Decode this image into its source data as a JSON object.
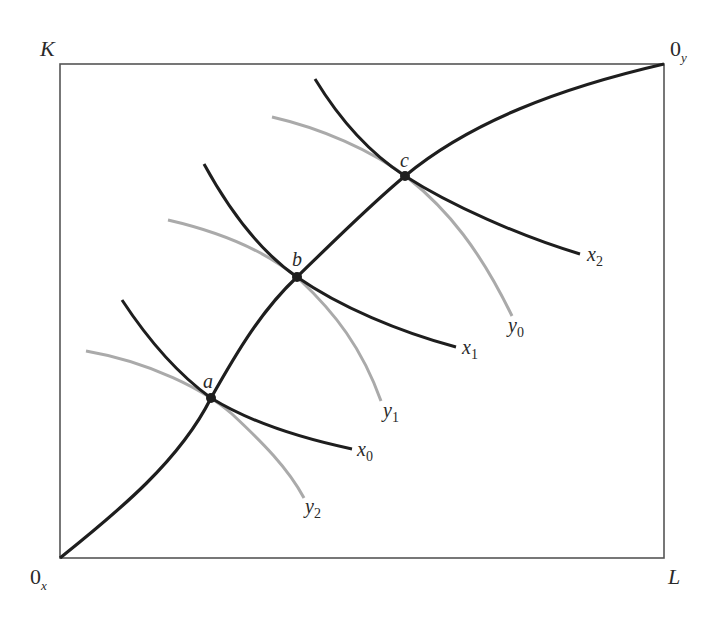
{
  "diagram": {
    "type": "edgeworth-box-production",
    "colors": {
      "frame": "#555555",
      "isoquant_x": "#1e1e1e",
      "isoquant_y": "#aaaaaa",
      "contract_curve": "#1e1e1e",
      "point": "#1e1e1e"
    },
    "axes": {
      "top_left_label": "K",
      "bottom_right_label": "L",
      "origin_x_label": "0",
      "origin_x_sub": "x",
      "origin_y_label": "0",
      "origin_y_sub": "y"
    },
    "points": [
      {
        "label": "a"
      },
      {
        "label": "b"
      },
      {
        "label": "c"
      }
    ],
    "isoquants_x": [
      {
        "label": "x",
        "sub": "0"
      },
      {
        "label": "x",
        "sub": "1"
      },
      {
        "label": "x",
        "sub": "2"
      }
    ],
    "isoquants_y": [
      {
        "label": "y",
        "sub": "2"
      },
      {
        "label": "y",
        "sub": "1"
      },
      {
        "label": "y",
        "sub": "0"
      }
    ]
  }
}
